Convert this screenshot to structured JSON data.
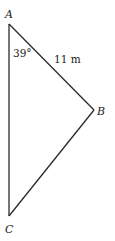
{
  "diagram": {
    "type": "triangle",
    "stroke_color": "#2a2a2a",
    "vertices": {
      "A": {
        "label": "A",
        "x": 9,
        "y": 24
      },
      "B": {
        "label": "B",
        "x": 94,
        "y": 110
      },
      "C": {
        "label": "C",
        "x": 9,
        "y": 216
      }
    },
    "sides": [
      {
        "from": "A",
        "to": "B",
        "label": "11 m"
      },
      {
        "from": "B",
        "to": "C",
        "label": ""
      },
      {
        "from": "A",
        "to": "C",
        "label": ""
      }
    ],
    "angles": [
      {
        "at": "A",
        "label": "39°"
      }
    ],
    "labels": {
      "vertex_a": "A",
      "vertex_b": "B",
      "vertex_c": "C",
      "angle_a": "39°",
      "side_ab": "11 m"
    }
  }
}
